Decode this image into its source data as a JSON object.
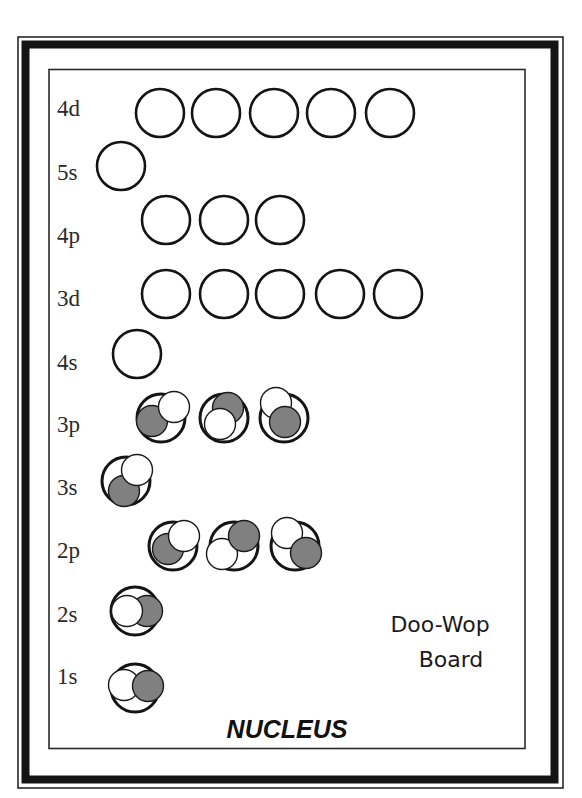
{
  "title": {
    "line1": "Doo-Wop",
    "line2": "Board"
  },
  "footer": {
    "nucleus_label": "NUCLEUS"
  },
  "colors": {
    "frame": "#141414",
    "electron_spin_up": "#ffffff",
    "electron_spin_down": "#808080"
  },
  "sublevels": [
    {
      "label": "4d",
      "orbitals": 5,
      "electrons": [
        [],
        [],
        [],
        [],
        []
      ]
    },
    {
      "label": "5s",
      "orbitals": 1,
      "electrons": [
        []
      ]
    },
    {
      "label": "4p",
      "orbitals": 3,
      "electrons": [
        [],
        [],
        []
      ]
    },
    {
      "label": "3d",
      "orbitals": 5,
      "electrons": [
        [],
        [],
        [],
        [],
        []
      ]
    },
    {
      "label": "4s",
      "orbitals": 1,
      "electrons": [
        []
      ]
    },
    {
      "label": "3p",
      "orbitals": 3,
      "electrons": [
        [
          "gray",
          "white"
        ],
        [
          "gray",
          "white"
        ],
        [
          "white",
          "gray"
        ]
      ]
    },
    {
      "label": "3s",
      "orbitals": 1,
      "electrons": [
        [
          "gray",
          "white"
        ]
      ]
    },
    {
      "label": "2p",
      "orbitals": 3,
      "electrons": [
        [
          "gray",
          "white"
        ],
        [
          "white",
          "gray"
        ],
        [
          "white",
          "gray"
        ]
      ]
    },
    {
      "label": "2s",
      "orbitals": 1,
      "electrons": [
        [
          "gray",
          "white"
        ]
      ]
    },
    {
      "label": "1s",
      "orbitals": 1,
      "electrons": [
        [
          "white",
          "gray"
        ]
      ]
    }
  ]
}
